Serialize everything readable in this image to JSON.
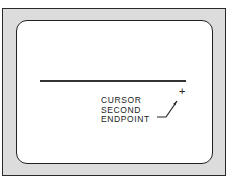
{
  "diagram": {
    "type": "crt-screen-illustration",
    "screen": {
      "drawn_line": {
        "description": "first segment drawn on screen"
      },
      "cursor_symbol": "+",
      "annotation": {
        "lines": [
          "CURSOR",
          "SECOND",
          "ENDPOINT"
        ]
      }
    }
  }
}
